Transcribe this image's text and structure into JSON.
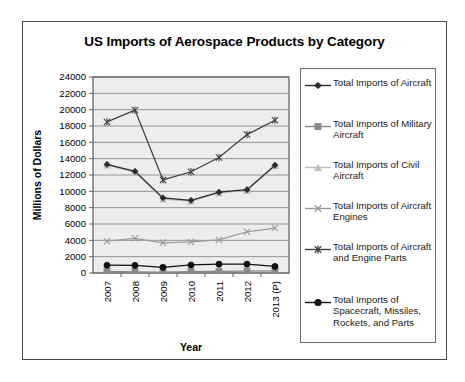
{
  "chart_data": {
    "type": "line",
    "title": "US Imports of Aerospace Products by Category",
    "xlabel": "Year",
    "ylabel": "Millions of Dollars",
    "categories": [
      "2007",
      "2008",
      "2009",
      "2010",
      "2011",
      "2012",
      "2013 (P)"
    ],
    "ylim": [
      0,
      24000
    ],
    "ytick_step": 2000,
    "yticks": [
      "24000",
      "22000",
      "20000",
      "18000",
      "16000",
      "14000",
      "12000",
      "10000",
      "8000",
      "6000",
      "4000",
      "2000",
      "0"
    ],
    "grid": "horizontal",
    "legend_position": "right",
    "plot_background": "#ededed",
    "series": [
      {
        "name": "Total Imports of Aircraft",
        "marker": "diamond",
        "color": "#2b2b2b",
        "values": [
          13300,
          12450,
          9200,
          8900,
          9900,
          10200,
          13200
        ]
      },
      {
        "name": "Total Imports of Military Aircraft",
        "marker": "square",
        "color": "#8a8a8a",
        "values": [
          200,
          150,
          120,
          160,
          200,
          220,
          260
        ]
      },
      {
        "name": "Total Imports of Civil Aircraft",
        "marker": "triangle",
        "color": "#bdbdbd",
        "values": [
          13200,
          12350,
          9050,
          8800,
          9800,
          10100,
          13100
        ]
      },
      {
        "name": "Total Imports of Aircraft Engines",
        "marker": "cross",
        "color": "#9a9a9a",
        "values": [
          3900,
          4250,
          3700,
          3800,
          4050,
          5050,
          5500
        ]
      },
      {
        "name": "Total Imports of Aircraft and Engine Parts",
        "marker": "star",
        "color": "#404040",
        "values": [
          18500,
          19950,
          11400,
          12400,
          14150,
          16950,
          18700
        ]
      },
      {
        "name": "Total Imports of Spacecraft, Missiles, Rockets, and Parts",
        "marker": "circle",
        "color": "#111111",
        "values": [
          950,
          930,
          700,
          980,
          1080,
          1080,
          800
        ]
      }
    ]
  },
  "legend": {
    "items": [
      "Total Imports of Aircraft",
      "Total Imports of Military Aircraft",
      "Total Imports of Civil Aircraft",
      "Total Imports of Aircraft Engines",
      "Total Imports of Aircraft and Engine Parts",
      "Total Imports of Spacecraft, Missiles, Rockets, and Parts"
    ]
  }
}
